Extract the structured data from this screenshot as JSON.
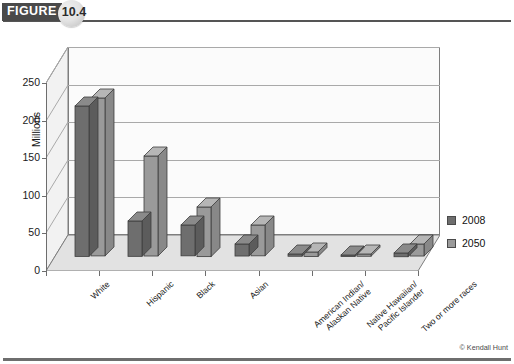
{
  "figure": {
    "tag_label": "FIGURE",
    "number": "10.4"
  },
  "credit": "© Kendall Hunt",
  "legend": {
    "position": "right",
    "entries": [
      {
        "label": "2008",
        "color": "#6e6e6e"
      },
      {
        "label": "2050",
        "color": "#9a9a9a"
      }
    ]
  },
  "chart_data": {
    "type": "bar",
    "title": "",
    "subtitle": "",
    "xlabel": "",
    "ylabel": "Millions",
    "ylim": [
      0,
      250
    ],
    "yticks": [
      0,
      50,
      100,
      150,
      200,
      250
    ],
    "ytick_labels": [
      "0",
      "50",
      "100",
      "150",
      "200",
      "250"
    ],
    "grid": true,
    "threed": true,
    "legend_position": "right",
    "categories": [
      "White",
      "Hispanic",
      "Black",
      "Asian",
      "American Indian/\nAlaskan Native",
      "Native Hawaiian/\nPacific Islander",
      "Two or more races"
    ],
    "category_lines": [
      [
        "White"
      ],
      [
        "Hispanic"
      ],
      [
        "Black"
      ],
      [
        "Asian"
      ],
      [
        "American Indian/",
        "Alaskan Native"
      ],
      [
        "Native Hawaiian/",
        "Pacific Islander"
      ],
      [
        "Two or more races"
      ]
    ],
    "series": [
      {
        "name": "2008",
        "color": "#6e6e6e",
        "values": [
          200,
          47,
          41,
          16,
          3,
          1,
          5
        ]
      },
      {
        "name": "2050",
        "color": "#9a9a9a",
        "values": [
          210,
          133,
          66,
          41,
          6,
          3,
          16
        ]
      }
    ]
  }
}
